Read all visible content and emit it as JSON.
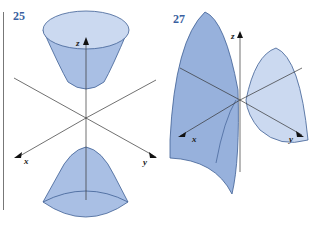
{
  "figures": [
    {
      "number": "25",
      "surface": "hyperboloid-of-two-sheets",
      "axes": {
        "x": "x",
        "y": "y",
        "z": "z"
      }
    },
    {
      "number": "27",
      "surface": "hyperbolic-paraboloid-saddle",
      "axes": {
        "x": "x",
        "y": "y",
        "z": "z"
      }
    }
  ],
  "colors": {
    "label": "#3a5fa0",
    "fill": "#b9cbea",
    "fill_dark": "#97b1dc",
    "stroke": "#3f5f94",
    "axis": "#333333"
  }
}
